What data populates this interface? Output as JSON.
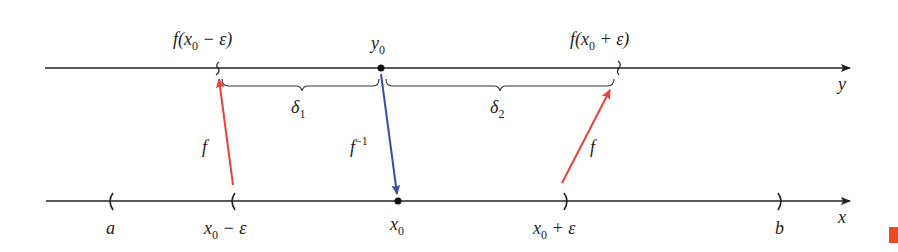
{
  "diagram": {
    "colors": {
      "axis": "#222222",
      "f_arrow": "#e8423f",
      "f_inverse_arrow": "#3a4fa0",
      "corner_mark": "#ee4a22"
    },
    "y_axis": {
      "label": "y",
      "points": {
        "left_endpoint": {
          "label_main": "f(x",
          "label_sub": "0",
          "label_rest": " − ε)"
        },
        "center": {
          "label_main": "y",
          "label_sub": "0"
        },
        "right_endpoint": {
          "label_main": "f(x",
          "label_sub": "0",
          "label_rest": " + ε)"
        }
      },
      "braces": [
        {
          "label_main": "δ",
          "label_sub": "1"
        },
        {
          "label_main": "δ",
          "label_sub": "2"
        }
      ]
    },
    "x_axis": {
      "label": "x",
      "points": {
        "a": {
          "label": "a"
        },
        "left": {
          "label_main": "x",
          "label_sub": "0",
          "label_rest": " − ε"
        },
        "center": {
          "label_main": "x",
          "label_sub": "0"
        },
        "right": {
          "label_main": "x",
          "label_sub": "0",
          "label_rest": " + ε"
        },
        "b": {
          "label": "b"
        }
      }
    },
    "arrows": [
      {
        "label": "f",
        "from": "x0 − ε",
        "to": "f(x0 − ε)"
      },
      {
        "label_main": "f",
        "label_sup": "−1",
        "from": "y0",
        "to": "x0"
      },
      {
        "label": "f",
        "from": "x0 + ε",
        "to": "f(x0 + ε)"
      }
    ]
  }
}
